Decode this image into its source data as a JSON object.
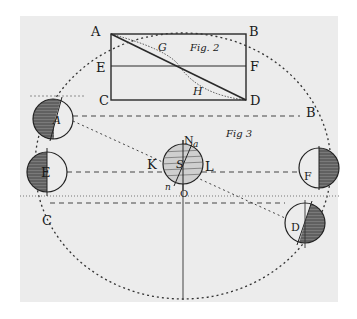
{
  "figure2": {
    "caption": "Fig. 2",
    "labels": {
      "A": "A",
      "B": "B",
      "C": "C",
      "D": "D",
      "E": "E",
      "F": "F",
      "G": "G",
      "H": "H"
    }
  },
  "figure3": {
    "caption": "Fig 3",
    "orbit_labels": {
      "A": "A",
      "B": "B",
      "C": "C",
      "D": "D",
      "E": "E",
      "F": "F"
    },
    "sun_labels": {
      "S": "S",
      "N": "N",
      "a": "a",
      "n": "n",
      "K": "K",
      "L": "L",
      "O": "O"
    }
  },
  "colors": {
    "paper": "#ececec",
    "ink": "#1a1a1a",
    "shade": "#555555"
  }
}
